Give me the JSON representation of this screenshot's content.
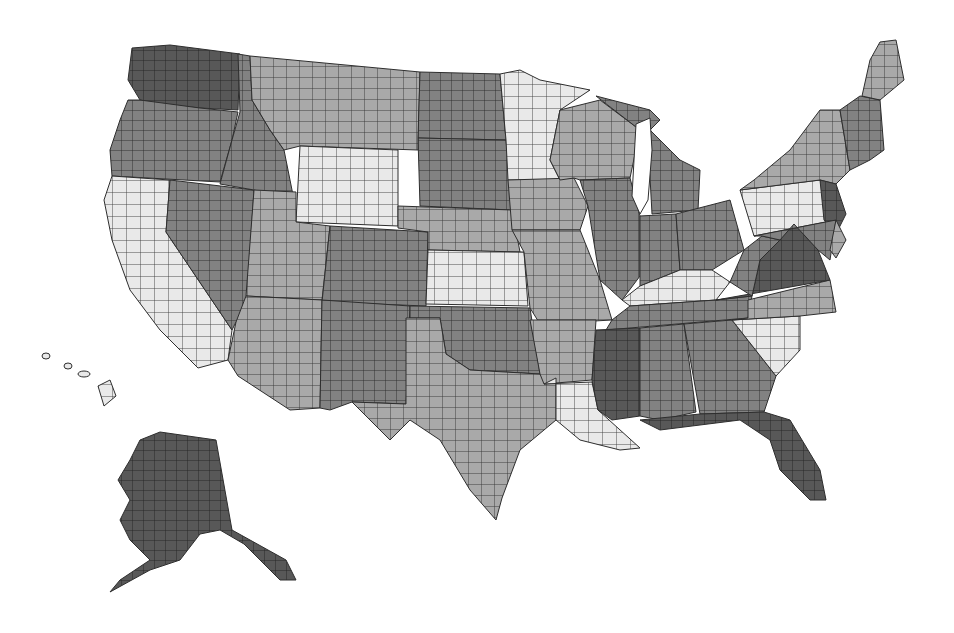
{
  "map": {
    "title": "",
    "type": "choropleth",
    "region": "United States counties",
    "legend": [],
    "shades": {
      "1": "#e9e9e9",
      "2": "#a9a9a9",
      "3": "#828282",
      "4": "#585858"
    },
    "county_line_color": "#2e2e2e",
    "states": [
      {
        "id": "WA",
        "shade": 4,
        "points": "132,48 170,45 240,54 238,110 200,108 160,104 140,100 128,80"
      },
      {
        "id": "OR",
        "shade": 3,
        "points": "128,100 140,100 200,108 238,112 232,140 220,182 112,176 110,150 120,120"
      },
      {
        "id": "CA",
        "shade": 1,
        "points": "112,176 170,180 166,232 232,330 228,360 198,368 160,330 130,290 112,240 104,200"
      },
      {
        "id": "NV",
        "shade": 3,
        "points": "170,180 254,190 246,312 236,322 232,330 166,232"
      },
      {
        "id": "ID",
        "shade": 3,
        "points": "238,54 250,56 252,100 270,130 284,150 294,200 254,190 220,184 232,140 240,112"
      },
      {
        "id": "MT",
        "shade": 2,
        "points": "250,56 420,72 418,150 300,146 284,150 270,130 252,100"
      },
      {
        "id": "WY",
        "shade": 1,
        "points": "300,146 398,150 398,226 296,222"
      },
      {
        "id": "UT",
        "shade": 2,
        "points": "254,190 296,192 296,222 330,226 322,300 246,296"
      },
      {
        "id": "CO",
        "shade": 3,
        "points": "330,226 428,232 426,306 322,302"
      },
      {
        "id": "AZ",
        "shade": 2,
        "points": "246,296 322,300 320,408 290,410 238,376 228,360 236,322"
      },
      {
        "id": "NM",
        "shade": 3,
        "points": "322,300 410,306 406,404 352,402 330,410 320,408"
      },
      {
        "id": "ND",
        "shade": 3,
        "points": "420,72 500,74 506,140 418,138"
      },
      {
        "id": "SD",
        "shade": 3,
        "points": "418,138 506,140 512,210 420,206"
      },
      {
        "id": "NE",
        "shade": 2,
        "points": "398,206 512,210 520,252 428,250 428,232 398,228"
      },
      {
        "id": "KS",
        "shade": 1,
        "points": "428,250 524,252 528,306 426,304"
      },
      {
        "id": "OK",
        "shade": 3,
        "points": "410,306 530,308 540,374 470,370 446,354 440,318 410,318"
      },
      {
        "id": "TX",
        "shade": 2,
        "points": "406,318 440,318 446,354 470,370 540,374 556,378 556,420 520,450 502,498 496,520 470,490 440,440 410,420 390,440 352,402 406,404"
      },
      {
        "id": "MN",
        "shade": 1,
        "points": "500,74 520,70 540,80 590,90 560,110 550,160 560,180 508,180 506,140"
      },
      {
        "id": "IA",
        "shade": 2,
        "points": "508,180 574,178 588,206 580,230 512,230"
      },
      {
        "id": "MO",
        "shade": 2,
        "points": "512,230 580,230 600,280 612,320 540,324 530,308 524,252"
      },
      {
        "id": "AR",
        "shade": 2,
        "points": "530,320 596,320 592,380 544,384 540,374"
      },
      {
        "id": "LA",
        "shade": 1,
        "points": "544,384 592,382 598,410 640,448 620,450 580,440 556,420 556,378"
      },
      {
        "id": "WI",
        "shade": 2,
        "points": "560,110 600,100 640,130 630,178 580,180 574,178 560,180 550,160"
      },
      {
        "id": "IL",
        "shade": 3,
        "points": "580,180 630,178 640,216 640,276 622,300 600,280 588,206"
      },
      {
        "id": "MI",
        "shade": 3,
        "points": "596,96 650,110 660,120 640,140 650,130 680,160 700,170 698,210 652,214 648,140 640,130"
      },
      {
        "id": "IN",
        "shade": 3,
        "points": "640,216 676,214 680,270 640,286 640,276"
      },
      {
        "id": "OH",
        "shade": 3,
        "points": "676,214 730,200 744,250 712,270 680,270"
      },
      {
        "id": "KY",
        "shade": 1,
        "points": "622,300 640,286 680,270 712,270 730,282 716,300 630,306"
      },
      {
        "id": "TN",
        "shade": 3,
        "points": "612,320 630,306 716,300 752,296 748,318 606,330"
      },
      {
        "id": "MS",
        "shade": 4,
        "points": "596,330 640,328 640,416 612,420 598,410 592,380"
      },
      {
        "id": "AL",
        "shade": 3,
        "points": "640,328 684,324 696,412 660,420 640,416"
      },
      {
        "id": "GA",
        "shade": 3,
        "points": "684,324 732,320 776,376 764,412 700,414"
      },
      {
        "id": "FL",
        "shade": 4,
        "points": "640,420 700,414 764,412 790,420 820,470 826,500 810,500 780,470 770,440 740,420 660,430"
      },
      {
        "id": "SC",
        "shade": 1,
        "points": "732,320 800,316 800,350 776,376"
      },
      {
        "id": "NC",
        "shade": 2,
        "points": "748,300 830,280 836,312 800,316 732,320 748,318"
      },
      {
        "id": "VA",
        "shade": 4,
        "points": "716,300 752,296 760,260 794,224 818,250 830,280"
      },
      {
        "id": "WV",
        "shade": 3,
        "points": "730,282 744,250 762,236 780,240 760,260 752,296"
      },
      {
        "id": "PA",
        "shade": 1,
        "points": "740,190 820,180 836,220 754,236"
      },
      {
        "id": "NY",
        "shade": 2,
        "points": "754,180 790,150 820,110 840,110 850,170 836,184 820,180 740,190"
      },
      {
        "id": "NJ",
        "shade": 4,
        "points": "820,180 836,184 846,214 836,234 824,220"
      },
      {
        "id": "MD",
        "shade": 3,
        "points": "754,236 836,220 830,260 818,250 794,224 780,240 762,236"
      },
      {
        "id": "DE",
        "shade": 2,
        "points": "836,220 846,240 836,258 830,250"
      },
      {
        "id": "NE_NEW_ENGLAND",
        "shade": 3,
        "points": "840,110 860,96 880,100 884,150 870,160 850,170"
      },
      {
        "id": "ME",
        "shade": 2,
        "points": "880,42 896,40 904,80 880,100 862,96 870,60"
      },
      {
        "id": "AK",
        "shade": 4,
        "points": "160,432 216,440 232,530 250,540 286,560 296,580 280,580 244,544 220,530 200,534 180,560 150,570 110,592 120,580 150,560 130,540 120,520 130,500 118,480 130,460 140,440"
      },
      {
        "id": "HI",
        "shade": 1,
        "points": "98,386 110,380 116,396 104,406"
      }
    ]
  }
}
